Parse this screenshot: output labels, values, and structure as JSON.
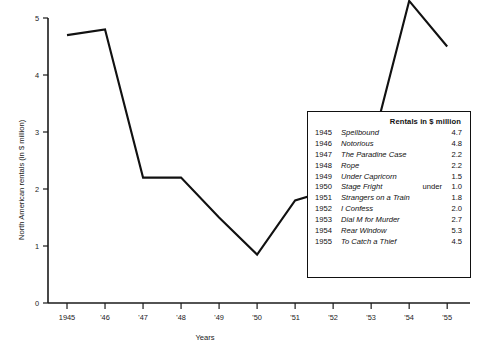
{
  "chart_data": {
    "type": "line",
    "title": "",
    "xlabel": "Years",
    "ylabel": "North American rentals (in $ million)",
    "x": [
      1945,
      1946,
      1947,
      1948,
      1949,
      1950,
      1951,
      1952,
      1953,
      1954,
      1955
    ],
    "xtick_labels": [
      "1945",
      "'46",
      "'47",
      "'48",
      "'49",
      "'50",
      "'51",
      "'52",
      "'53",
      "'54",
      "'55"
    ],
    "ytick_labels": [
      "0",
      "1",
      "2",
      "3",
      "4",
      "5"
    ],
    "ytick_values": [
      0,
      1,
      2,
      3,
      4,
      5
    ],
    "values": [
      4.7,
      4.8,
      2.2,
      2.2,
      1.5,
      0.85,
      1.8,
      2.0,
      2.7,
      5.3,
      4.5
    ],
    "series": [
      {
        "name": "North American rentals",
        "values": [
          4.7,
          4.8,
          2.2,
          2.2,
          1.5,
          0.85,
          1.8,
          2.0,
          2.7,
          5.3,
          4.5
        ]
      }
    ],
    "xlim": [
      1944.5,
      1955.6
    ],
    "ylim": [
      0,
      5
    ],
    "grid": false,
    "legend_position": "inset-bottom-right",
    "line_color": "#111111"
  },
  "legend": {
    "header": "Rentals in $ million",
    "rows": [
      {
        "year": "1945",
        "title": "Spellbound",
        "qualifier": "",
        "value": "4.7"
      },
      {
        "year": "1946",
        "title": "Notorious",
        "qualifier": "",
        "value": "4.8"
      },
      {
        "year": "1947",
        "title": "The Paradine Case",
        "qualifier": "",
        "value": "2.2"
      },
      {
        "year": "1948",
        "title": "Rope",
        "qualifier": "",
        "value": "2.2"
      },
      {
        "year": "1949",
        "title": "Under Capricorn",
        "qualifier": "",
        "value": "1.5"
      },
      {
        "year": "1950",
        "title": "Stage Fright",
        "qualifier": "under",
        "value": "1.0"
      },
      {
        "year": "1951",
        "title": "Strangers on a Train",
        "qualifier": "",
        "value": "1.8"
      },
      {
        "year": "1952",
        "title": "I Confess",
        "qualifier": "",
        "value": "2.0"
      },
      {
        "year": "1953",
        "title": "Dial M for Murder",
        "qualifier": "",
        "value": "2.7"
      },
      {
        "year": "1954",
        "title": "Rear Window",
        "qualifier": "",
        "value": "5.3"
      },
      {
        "year": "1955",
        "title": "To Catch a Thief",
        "qualifier": "",
        "value": "4.5"
      }
    ]
  }
}
